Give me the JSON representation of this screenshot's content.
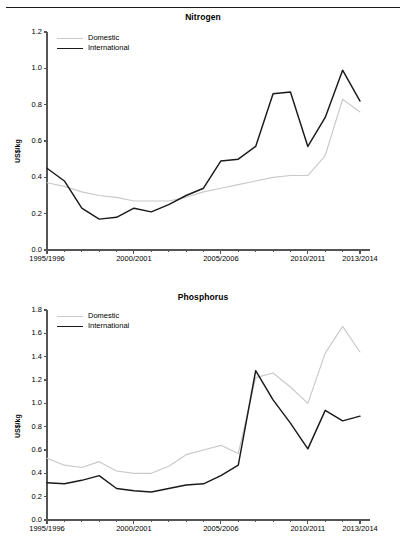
{
  "page": {
    "rule_color": "#1a1a1a"
  },
  "series_colors": {
    "domestic": "#c9c9c9",
    "international": "#1a1a1a"
  },
  "legend": {
    "domestic_label": "Domestic",
    "international_label": "International"
  },
  "axis": {
    "ylabel": "US$/kg"
  },
  "chart_data": [
    {
      "type": "line",
      "title": "Nitrogen",
      "xlabel": "",
      "ylabel": "US$/kg",
      "ylim": [
        0.0,
        1.2
      ],
      "yticks": [
        "0.0",
        "0.2",
        "0.4",
        "0.6",
        "0.8",
        "1.0",
        "1.2"
      ],
      "ytick_values": [
        0.0,
        0.2,
        0.4,
        0.6,
        0.8,
        1.0,
        1.2
      ],
      "grid": false,
      "legend_position": "top-left",
      "x": [
        "1995/1996",
        "1996/1997",
        "1997/1998",
        "1998/1999",
        "1999/2000",
        "2000/2001",
        "2001/2002",
        "2002/2003",
        "2003/2004",
        "2004/2005",
        "2005/2006",
        "2006/2007",
        "2007/2008",
        "2008/2009",
        "2009/2010",
        "2010/2011",
        "2011/2012",
        "2012/2013",
        "2013/2014"
      ],
      "xtick_labels": [
        "1995/1996",
        "2000/2001",
        "2005/2006",
        "2010/2011",
        "2013/2014"
      ],
      "xtick_indices": [
        0,
        5,
        10,
        15,
        18
      ],
      "series": [
        {
          "name": "Domestic",
          "color": "#c9c9c9",
          "values": [
            0.37,
            0.35,
            0.32,
            0.3,
            0.29,
            0.27,
            0.27,
            0.27,
            0.29,
            0.32,
            0.34,
            0.36,
            0.38,
            0.4,
            0.41,
            0.41,
            0.52,
            0.83,
            0.76,
            0.75
          ]
        },
        {
          "name": "International",
          "color": "#1a1a1a",
          "values": [
            0.45,
            0.38,
            0.23,
            0.17,
            0.18,
            0.23,
            0.21,
            0.25,
            0.3,
            0.34,
            0.49,
            0.5,
            0.57,
            0.86,
            0.87,
            0.57,
            0.73,
            0.99,
            0.82,
            0.68
          ]
        }
      ]
    },
    {
      "type": "line",
      "title": "Phosphorus",
      "xlabel": "",
      "ylabel": "US$/kg",
      "ylim": [
        0.0,
        1.8
      ],
      "yticks": [
        "0.0",
        "0.2",
        "0.4",
        "0.6",
        "0.8",
        "1.0",
        "1.2",
        "1.4",
        "1.6",
        "1.8"
      ],
      "ytick_values": [
        0.0,
        0.2,
        0.4,
        0.6,
        0.8,
        1.0,
        1.2,
        1.4,
        1.6,
        1.8
      ],
      "grid": false,
      "legend_position": "top-left",
      "x": [
        "1995/1996",
        "1996/1997",
        "1997/1998",
        "1998/1999",
        "1999/2000",
        "2000/2001",
        "2001/2002",
        "2002/2003",
        "2003/2004",
        "2004/2005",
        "2005/2006",
        "2006/2007",
        "2007/2008",
        "2008/2009",
        "2009/2010",
        "2010/2011",
        "2011/2012",
        "2012/2013",
        "2013/2014"
      ],
      "xtick_labels": [
        "1995/1996",
        "2000/2001",
        "2005/2006",
        "2010/2011",
        "2013/2014"
      ],
      "xtick_indices": [
        0,
        5,
        10,
        15,
        18
      ],
      "series": [
        {
          "name": "Domestic",
          "color": "#c9c9c9",
          "values": [
            0.53,
            0.47,
            0.45,
            0.5,
            0.42,
            0.4,
            0.4,
            0.46,
            0.56,
            0.6,
            0.64,
            0.57,
            1.22,
            1.26,
            1.14,
            1.0,
            1.43,
            1.66,
            1.44,
            1.21
          ]
        },
        {
          "name": "International",
          "color": "#1a1a1a",
          "values": [
            0.32,
            0.31,
            0.34,
            0.38,
            0.27,
            0.25,
            0.24,
            0.27,
            0.3,
            0.31,
            0.38,
            0.47,
            1.28,
            1.03,
            0.83,
            0.61,
            0.94,
            0.85,
            0.89,
            0.73
          ]
        }
      ]
    }
  ]
}
